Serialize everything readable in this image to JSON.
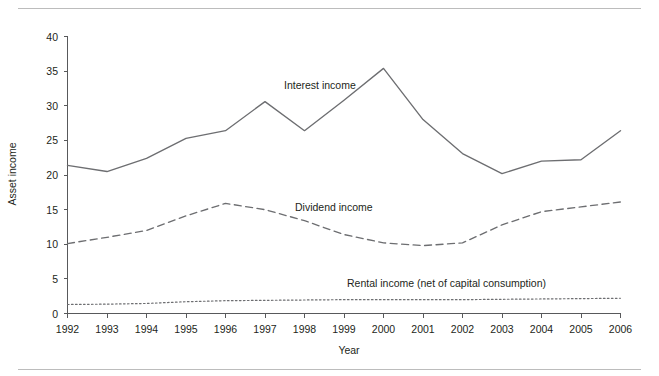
{
  "chart_data": {
    "type": "line",
    "title": "",
    "xlabel": "Year",
    "ylabel": "Asset income",
    "x": [
      1992,
      1993,
      1994,
      1995,
      1996,
      1997,
      1998,
      1999,
      2000,
      2001,
      2002,
      2003,
      2004,
      2005,
      2006
    ],
    "xtick_labels": [
      "1992",
      "1993",
      "1994",
      "1995",
      "1996",
      "1997",
      "1998",
      "1999",
      "2000",
      "2001",
      "2002",
      "2003",
      "2004",
      "2005",
      "2006"
    ],
    "ytick_labels": [
      "0",
      "5",
      "10",
      "15",
      "20",
      "25",
      "30",
      "35",
      "40"
    ],
    "yticks": [
      0,
      5,
      10,
      15,
      20,
      25,
      30,
      35,
      40
    ],
    "ylim": [
      0,
      40
    ],
    "xlim": [
      1992,
      2006
    ],
    "grid": false,
    "legend_position": "inline-annotations",
    "series": [
      {
        "name": "Interest income",
        "label": "Interest income",
        "style": "solid",
        "color": "#6d6e71",
        "values": [
          21.4,
          20.5,
          22.4,
          25.3,
          26.4,
          30.6,
          26.4,
          30.8,
          35.4,
          28.0,
          23.1,
          20.2,
          22.0,
          22.2,
          26.4
        ]
      },
      {
        "name": "Dividend income",
        "label": "Dividend income",
        "style": "dashed",
        "color": "#6d6e71",
        "values": [
          10.1,
          11.0,
          12.0,
          14.1,
          15.9,
          15.0,
          13.4,
          11.4,
          10.2,
          9.8,
          10.2,
          12.8,
          14.7,
          15.4,
          16.1
        ]
      },
      {
        "name": "Rental income (net of capital consumption)",
        "label": "Rental income (net of capital consumption)",
        "style": "dotted",
        "color": "#6d6e71",
        "values": [
          1.3,
          1.35,
          1.45,
          1.7,
          1.85,
          1.9,
          1.95,
          2.0,
          2.0,
          2.0,
          2.0,
          2.05,
          2.1,
          2.15,
          2.2
        ]
      }
    ],
    "colors": {
      "axis": "#58595b",
      "ink": "#231f20",
      "rule": "#bcbcbc",
      "background": "#ffffff"
    }
  }
}
